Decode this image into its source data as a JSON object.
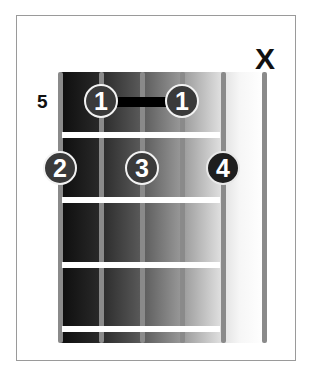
{
  "diagram": {
    "type": "guitar-chord-diagram",
    "starting_fret_label": "5",
    "muted_marker": "X",
    "muted_string_index": 5,
    "strings": 6,
    "frets_shown": 4,
    "barre": {
      "finger": "1",
      "from_string": 1,
      "to_string": 3,
      "fret": 1
    },
    "fingers": [
      {
        "label": "1",
        "string": 1,
        "fret": 1
      },
      {
        "label": "1",
        "string": 3,
        "fret": 1
      },
      {
        "label": "2",
        "string": 0,
        "fret": 2
      },
      {
        "label": "3",
        "string": 2,
        "fret": 2
      },
      {
        "label": "4",
        "string": 4,
        "fret": 2
      }
    ],
    "colors": {
      "board_dark": "#0d0d0d",
      "board_light": "#f6f6f6",
      "string": "#8a8a8a",
      "fret": "#ffffff",
      "dot_fill": "#3a3a3a",
      "dot_text": "#ffffff",
      "barre": "#000000"
    }
  }
}
